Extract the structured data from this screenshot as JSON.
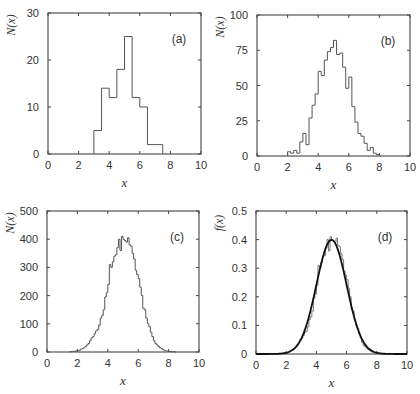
{
  "chart_data": [
    {
      "id": "a",
      "type": "bar",
      "panel_label": "(a)",
      "xlabel": "x",
      "ylabel": "N(x)",
      "xlim": [
        0,
        10
      ],
      "ylim": [
        0,
        30
      ],
      "xticks": [
        0,
        2,
        4,
        6,
        8,
        10
      ],
      "yticks": [
        0,
        10,
        20,
        30
      ],
      "bin_width": 0.5,
      "bin_starts": [
        3.0,
        3.5,
        4.0,
        4.5,
        5.0,
        5.5,
        6.0,
        6.5,
        7.0
      ],
      "values": [
        5,
        14,
        12,
        18,
        25,
        12,
        10,
        2,
        2
      ],
      "frame": {
        "x0": 48,
        "y0": 13,
        "x1": 201,
        "y1": 154
      }
    },
    {
      "id": "b",
      "type": "bar",
      "panel_label": "(b)",
      "xlabel": "x",
      "ylabel": "N(x)",
      "xlim": [
        0,
        10
      ],
      "ylim": [
        0,
        100
      ],
      "xticks": [
        0,
        2,
        4,
        6,
        8,
        10
      ],
      "yticks": [
        0,
        25,
        50,
        75,
        100
      ],
      "bin_width": 0.2,
      "bin_starts": [
        2.0,
        2.2,
        2.4,
        2.6,
        2.8,
        3.0,
        3.2,
        3.4,
        3.6,
        3.8,
        4.0,
        4.2,
        4.4,
        4.6,
        4.8,
        5.0,
        5.2,
        5.4,
        5.6,
        5.8,
        6.0,
        6.2,
        6.4,
        6.6,
        6.8,
        7.0,
        7.2,
        7.4,
        7.6,
        7.8
      ],
      "values": [
        3,
        2,
        4,
        2,
        10,
        16,
        8,
        27,
        36,
        44,
        60,
        57,
        68,
        74,
        77,
        82,
        72,
        73,
        63,
        48,
        56,
        35,
        24,
        16,
        14,
        9,
        4,
        6,
        2,
        1
      ],
      "frame": {
        "x0": 257,
        "y0": 15,
        "x1": 410,
        "y1": 156
      }
    },
    {
      "id": "c",
      "type": "bar",
      "panel_label": "(c)",
      "xlabel": "x",
      "ylabel": "N(x)",
      "xlim": [
        0,
        10
      ],
      "ylim": [
        0,
        500
      ],
      "xticks": [
        0,
        2,
        4,
        6,
        8,
        10
      ],
      "yticks": [
        0,
        100,
        200,
        300,
        400,
        500
      ],
      "bin_width": 0.1,
      "bin_start": 1.5,
      "values": [
        1,
        2,
        2,
        3,
        4,
        5,
        6,
        10,
        12,
        15,
        20,
        25,
        30,
        40,
        50,
        55,
        65,
        75,
        80,
        95,
        120,
        130,
        150,
        195,
        210,
        240,
        310,
        300,
        320,
        340,
        345,
        370,
        400,
        360,
        410,
        400,
        395,
        390,
        405,
        380,
        375,
        350,
        330,
        290,
        275,
        260,
        230,
        200,
        155,
        150,
        120,
        100,
        90,
        70,
        55,
        40,
        30,
        25,
        20,
        15,
        12,
        8,
        6,
        4,
        3,
        2,
        2,
        1,
        1,
        0
      ],
      "frame": {
        "x0": 47,
        "y0": 211,
        "x1": 199,
        "y1": 352
      }
    },
    {
      "id": "d",
      "type": "line",
      "panel_label": "(d)",
      "xlabel": "x",
      "ylabel": "f(x)",
      "xlim": [
        0,
        10
      ],
      "ylim": [
        0,
        0.5
      ],
      "xticks": [
        0,
        2,
        4,
        6,
        8,
        10
      ],
      "yticks": [
        0,
        0.1,
        0.2,
        0.3,
        0.4,
        0.5
      ],
      "ytick_labels": [
        "0",
        "0.1",
        "0.2",
        "0.3",
        "0.4",
        "0.5"
      ],
      "histogram": {
        "bin_width": 0.1,
        "bin_start": 1.5,
        "normalization": 1000,
        "source": "c"
      },
      "curve": {
        "type": "gaussian",
        "mean": 5,
        "sigma": 1,
        "peak": 0.399
      },
      "frame": {
        "x0": 256,
        "y0": 211,
        "x1": 407,
        "y1": 354
      }
    }
  ]
}
